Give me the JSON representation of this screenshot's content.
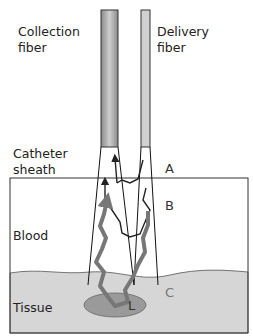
{
  "labels": {
    "collection_fiber": "Collection\nfiber",
    "delivery_fiber": "Delivery\nfiber",
    "catheter_sheath": "Catheter\nsheath",
    "blood": "Blood",
    "tissue": "Tissue"
  },
  "markers": {
    "a": "A",
    "b": "B",
    "c": "C",
    "l": "L"
  },
  "colors": {
    "fiber_gray": "#9a9a9a",
    "tissue": "#d6d6d6",
    "lesion": "#9a9a9a",
    "photon_path_thick": "#777777",
    "photon_path_thin": "#222222"
  }
}
